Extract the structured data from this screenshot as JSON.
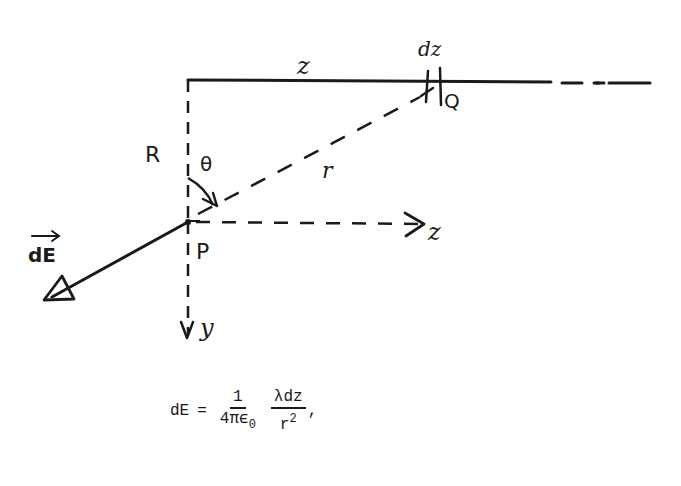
{
  "figure": {
    "type": "physics-diagram",
    "labels": {
      "z_top": "z",
      "dz": "dz",
      "Q": "Q",
      "R": "R",
      "theta": "θ",
      "r": "r",
      "P": "P",
      "z_axis": "z",
      "y_axis": "y",
      "dE_vector": "dE"
    },
    "colors": {
      "ink": "#1a1a1a",
      "background": "#ffffff"
    }
  },
  "equation": {
    "lhs": "dE",
    "equals": "=",
    "frac1": {
      "numerator": "1",
      "denominator_main": "4πϵ",
      "denominator_sub": "0"
    },
    "frac2": {
      "numerator": "λdz",
      "denominator_main": "r",
      "denominator_sup": "2"
    },
    "trailing": ","
  }
}
